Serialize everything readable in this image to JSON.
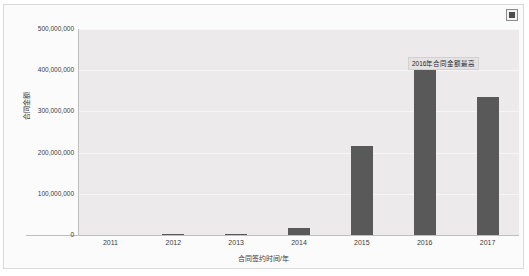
{
  "widget": {
    "corner_icon": "broken-image-icon"
  },
  "chart_data": {
    "type": "bar",
    "title": "",
    "categories": [
      "2011",
      "2012",
      "2013",
      "2014",
      "2015",
      "2016",
      "2017"
    ],
    "values": [
      0,
      1500000,
      2500000,
      18000000,
      217000000,
      400000000,
      335000000
    ],
    "series": [
      {
        "name": "合同金额",
        "values": [
          0,
          1500000,
          2500000,
          18000000,
          217000000,
          400000000,
          335000000
        ]
      }
    ],
    "xlabel": "合同签约时间/年",
    "ylabel": "合同金额",
    "ylim": [
      0,
      500000000
    ],
    "ytick_values": [
      0,
      100000000,
      200000000,
      300000000,
      400000000,
      500000000
    ],
    "ytick_labels": [
      "0",
      "100,000,000",
      "200,000,000",
      "300,000,000",
      "400,000,000",
      "500,000,000"
    ],
    "grid": true,
    "legend": false,
    "bar_color": "#595959",
    "plot_background": "#eceaea",
    "annotations": [
      {
        "text": "2016年合同金额最高",
        "target_category": "2016"
      }
    ]
  }
}
